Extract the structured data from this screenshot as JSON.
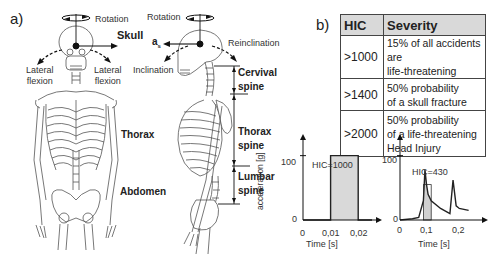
{
  "panel_a": {
    "label": "a)",
    "front_view": {
      "rotation": "Rotation",
      "skull": "Skull",
      "lateral_flexion_left": [
        "Lateral",
        "flexion"
      ],
      "lateral_flexion_right": [
        "Lateral",
        "flexion"
      ],
      "thorax": "Thorax",
      "abdomen": "Abdomen"
    },
    "side_view": {
      "rotation": "Rotation",
      "a_s": "a",
      "a_s_sub": "s",
      "reinclination": "Reinclination",
      "inclination": "Inclination",
      "cervical_spine": [
        "Cervival",
        "spine"
      ],
      "thorax_spine": [
        "Thorax",
        "spine"
      ],
      "lumbar_spine": [
        "Lumbar",
        "spine"
      ]
    }
  },
  "panel_b": {
    "label": "b)",
    "table": {
      "headers": [
        "HIC",
        "Severity"
      ],
      "rows": [
        {
          "hic": ">1000",
          "severity": [
            "15% of all accidents are",
            "life-threatening"
          ]
        },
        {
          "hic": ">1400",
          "severity": [
            "50% probability",
            "of a skull fracture"
          ]
        },
        {
          "hic": ">2000",
          "severity": [
            "50% probability",
            "of a life-threatening",
            "Head Injury"
          ]
        }
      ]
    }
  },
  "chart_data": [
    {
      "type": "line",
      "title": "HIC=1000",
      "xlabel": "Time [s]",
      "ylabel": "acceleration [g]",
      "x_ticks": [
        "0",
        "0,01",
        "0,02"
      ],
      "y_ticks": [
        "0",
        "100"
      ],
      "xlim": [
        0,
        0.025
      ],
      "ylim": [
        0,
        115
      ],
      "series": [
        {
          "name": "acceleration",
          "x": [
            0,
            0.01,
            0.01,
            0.02,
            0.02,
            0.025
          ],
          "y": [
            0,
            0,
            100,
            100,
            0,
            0
          ]
        }
      ],
      "shaded_interval": [
        0.01,
        0.02
      ],
      "grid": false
    },
    {
      "type": "line",
      "title": "HIC=430",
      "xlabel": "Time [s]",
      "ylabel": "",
      "x_ticks": [
        "0",
        "0,1",
        "0,2"
      ],
      "y_ticks": [
        "0",
        "100"
      ],
      "xlim": [
        0,
        0.25
      ],
      "ylim": [
        0,
        115
      ],
      "series": [
        {
          "name": "acceleration",
          "x": [
            0,
            0.04,
            0.06,
            0.075,
            0.08,
            0.085,
            0.09,
            0.1,
            0.13,
            0.16,
            0.17,
            0.18,
            0.19,
            0.22
          ],
          "y": [
            0,
            2,
            4,
            30,
            78,
            55,
            40,
            30,
            18,
            10,
            62,
            22,
            18,
            15
          ]
        }
      ],
      "shaded_interval": [
        0.075,
        0.1
      ],
      "shaded_level": 55,
      "grid": false
    }
  ]
}
